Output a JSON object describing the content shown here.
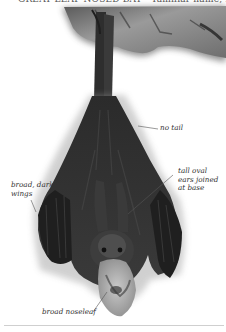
{
  "header": {
    "caption_cropped": "GREAT LEAF-NOSED BAT  ·  Tamiliar name, Habitat, distribution"
  },
  "annotations": [
    {
      "id": "no-tail",
      "text": "no tail"
    },
    {
      "id": "ears",
      "lines": [
        "tall oval",
        "ears joined",
        "at base"
      ]
    },
    {
      "id": "wings",
      "lines": [
        "broad, dark",
        "wings"
      ]
    },
    {
      "id": "noseleaf",
      "text": "broad noseleaf"
    }
  ],
  "colors": {
    "label_text": "#333333",
    "rule": "#cfcfcf",
    "rock": "#8a8a8a",
    "bat_body": "#2a2a2a"
  }
}
